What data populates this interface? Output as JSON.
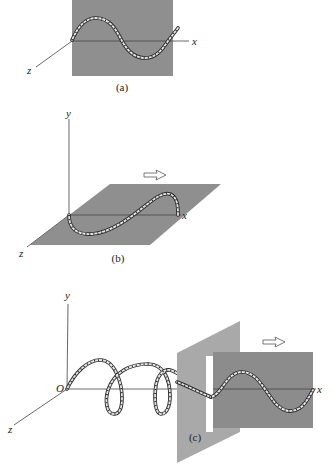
{
  "figure": {
    "panels": [
      {
        "id": "a",
        "caption": "(a)",
        "description": "Transverse wave on a rope oscillating in the vertical plane (gray plane)",
        "axis_labels": {
          "x": "x",
          "z": "z"
        },
        "colors": {
          "plane": "#8f8f8f"
        }
      },
      {
        "id": "b",
        "caption": "(b)",
        "description": "Transverse wave on a rope oscillating in the horizontal plane",
        "axis_labels": {
          "x": "x",
          "y": "y",
          "z": "z"
        },
        "arrow": "propagation-direction",
        "colors": {
          "plane": "#8f8f8f"
        }
      },
      {
        "id": "c",
        "caption": "(c)",
        "description": "Helical wave passing through a vertical slit emerges as a vertically polarized wave",
        "axis_labels": {
          "x": "x",
          "y": "y",
          "z": "z",
          "origin": "O"
        },
        "arrow": "propagation-direction",
        "colors": {
          "slit_plate": "#a9a9a9",
          "wave_plane": "#8c8c8c",
          "slit": "#ffffff"
        }
      }
    ]
  }
}
